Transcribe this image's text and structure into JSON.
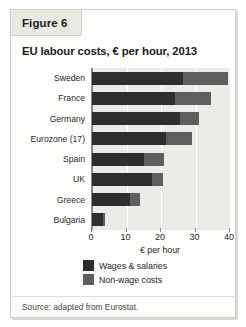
{
  "figure": {
    "tab_label": "Figure 6",
    "title": "EU labour costs, € per hour, 2013",
    "source": "Source: adapted from Eurostat."
  },
  "colors": {
    "wages": "#2e2e2e",
    "nonwage": "#5e5e5e",
    "plot_background": "#ebebe8",
    "card_background": "#fdfdfc",
    "tab_background": "#e9e9e4",
    "axis": "#8a8a86",
    "gridline": "#ffffff"
  },
  "chart_data": {
    "type": "bar",
    "orientation": "horizontal",
    "stacked": true,
    "title": "EU labour costs, € per hour, 2013",
    "xlabel": "€ per hour",
    "ylabel": "",
    "xlim": [
      0,
      40
    ],
    "xticks": [
      0,
      10,
      20,
      30,
      40
    ],
    "grid": true,
    "legend_position": "bottom",
    "categories": [
      "Sweden",
      "France",
      "Germany",
      "Eurozone (17)",
      "Spain",
      "UK",
      "Greece",
      "Bulgaria"
    ],
    "series": [
      {
        "name": "Wages & salaries",
        "color": "#2e2e2e",
        "values": [
          26.5,
          24.0,
          25.5,
          21.5,
          15.0,
          17.5,
          11.0,
          3.2
        ]
      },
      {
        "name": "Non-wage costs",
        "color": "#5e5e5e",
        "values": [
          13.0,
          10.5,
          5.5,
          7.5,
          6.0,
          3.0,
          3.0,
          0.6
        ]
      }
    ],
    "totals": [
      39.5,
      34.5,
      31.0,
      29.0,
      21.0,
      20.5,
      14.0,
      3.8
    ]
  }
}
